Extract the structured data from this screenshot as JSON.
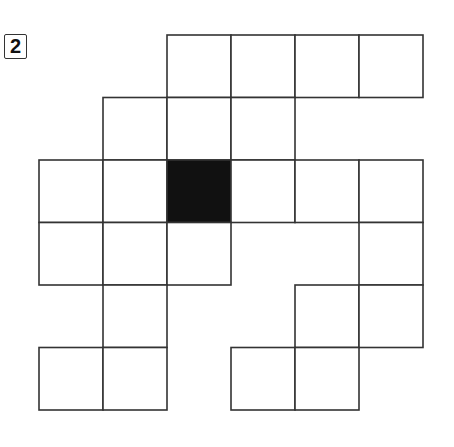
{
  "label": "2",
  "grid": {
    "origin_x": 39,
    "origin_y": 35,
    "cell_w": 64,
    "cell_h": 62.5,
    "line_color": "#333333",
    "fill_color": "#ffffff",
    "shaded_color": "#111111",
    "cells": [
      {
        "row": 0,
        "col": 2
      },
      {
        "row": 0,
        "col": 3
      },
      {
        "row": 0,
        "col": 4
      },
      {
        "row": 0,
        "col": 5
      },
      {
        "row": 1,
        "col": 1
      },
      {
        "row": 1,
        "col": 2
      },
      {
        "row": 1,
        "col": 3
      },
      {
        "row": 2,
        "col": 0
      },
      {
        "row": 2,
        "col": 1
      },
      {
        "row": 2,
        "col": 2,
        "shaded": true
      },
      {
        "row": 2,
        "col": 3
      },
      {
        "row": 2,
        "col": 4
      },
      {
        "row": 2,
        "col": 5
      },
      {
        "row": 3,
        "col": 0
      },
      {
        "row": 3,
        "col": 1
      },
      {
        "row": 3,
        "col": 2
      },
      {
        "row": 3,
        "col": 5
      },
      {
        "row": 4,
        "col": 1
      },
      {
        "row": 4,
        "col": 4
      },
      {
        "row": 4,
        "col": 5
      },
      {
        "row": 5,
        "col": 0
      },
      {
        "row": 5,
        "col": 1
      },
      {
        "row": 5,
        "col": 3
      },
      {
        "row": 5,
        "col": 4
      }
    ]
  }
}
